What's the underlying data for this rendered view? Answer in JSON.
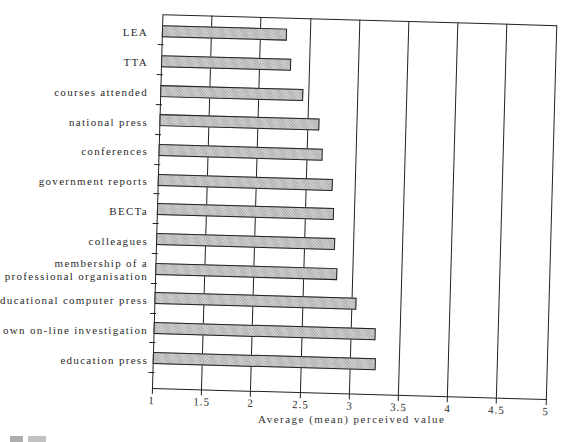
{
  "chart_data": {
    "type": "bar",
    "orientation": "horizontal",
    "title": "",
    "xlabel": "Average (mean) perceived value",
    "ylabel": "",
    "xlim": [
      1,
      5
    ],
    "x_ticks": [
      "1",
      "1.5",
      "2",
      "2.5",
      "3",
      "3.5",
      "4",
      "4.5",
      "5"
    ],
    "grid": true,
    "legend": null,
    "categories": [
      "LEA",
      "TTA",
      "courses attended",
      "national press",
      "conferences",
      "government reports",
      "BECTa",
      "colleagues",
      "membership of a professional organisation",
      "educational computer press",
      "own on-line investigation",
      "education press"
    ],
    "values": [
      2.27,
      2.32,
      2.45,
      2.62,
      2.67,
      2.78,
      2.8,
      2.82,
      2.85,
      3.05,
      3.25,
      3.26
    ],
    "bar_color": "#b4b4b4"
  },
  "labels": {
    "cat0": "LEA",
    "cat1": "TTA",
    "cat2": "courses attended",
    "cat3": "national press",
    "cat4": "conferences",
    "cat5": "government reports",
    "cat6": "BECTa",
    "cat7": "colleagues",
    "cat8_line1": "membership of a",
    "cat8_line2": "professional organisation",
    "cat9": "educational computer press",
    "cat10": "own on-line investigation",
    "cat11": "education press",
    "x_title": "Average (mean) perceived value",
    "ticks": [
      "1",
      "1.5",
      "2",
      "2.5",
      "3",
      "3.5",
      "4",
      "4.5",
      "5"
    ]
  }
}
